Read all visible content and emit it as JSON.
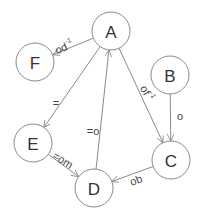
{
  "diagram": {
    "type": "directed-graph",
    "nodes": [
      {
        "id": "A",
        "label": "A"
      },
      {
        "id": "F",
        "label": "F"
      },
      {
        "id": "B",
        "label": "B"
      },
      {
        "id": "E",
        "label": "E"
      },
      {
        "id": "C",
        "label": "C"
      },
      {
        "id": "D",
        "label": "D"
      }
    ],
    "edges": [
      {
        "from": "A",
        "to": "F",
        "label": "od",
        "superscript": "-1"
      },
      {
        "from": "A",
        "to": "E",
        "label": "=",
        "superscript": ""
      },
      {
        "from": "A",
        "to": "C",
        "label": "of",
        "superscript": "-1"
      },
      {
        "from": "D",
        "to": "A",
        "label": "=o",
        "superscript": ""
      },
      {
        "from": "B",
        "to": "C",
        "label": "o",
        "superscript": ""
      },
      {
        "from": "E",
        "to": "D",
        "label": "=om",
        "superscript": ""
      },
      {
        "from": "C",
        "to": "D",
        "label": "ob",
        "superscript": ""
      }
    ]
  }
}
